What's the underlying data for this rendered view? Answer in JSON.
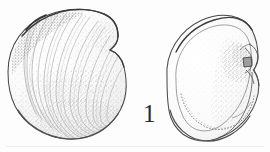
{
  "plate": {
    "type": "scientific-illustration-plate",
    "subject": "fossil bivalve shell, two views",
    "background_color": "#fdfdfd",
    "ink_color": "#3a3a3a",
    "stipple_color": "#8a8a8a",
    "figure_label": "1",
    "specimens": [
      {
        "id": "left-specimen",
        "name": "exterior-valve-view",
        "description": "Exterior of left valve showing concentric growth lines radiating from the umbo at upper left, broadly ovate-trigonal outline, densely stippled surface with darker shading along the dorsal and anterior margins.",
        "features": [
          "umbo",
          "concentric-growth-lines",
          "posterior-margin",
          "ventral-margin",
          "stippled-shading"
        ]
      },
      {
        "id": "right-specimen",
        "name": "interior-valve-view",
        "description": "Interior of valve showing pallial line running parallel to the ventral margin, muscle scar region stippled at the right, and a raised hinge plate with cardinal tooth at the right margin.",
        "features": [
          "pallial-line",
          "adductor-muscle-scar",
          "hinge-plate",
          "cardinal-tooth",
          "inner-margin"
        ]
      }
    ],
    "baseline_rule": {
      "visible": true,
      "color": "#e4e4e4"
    }
  }
}
